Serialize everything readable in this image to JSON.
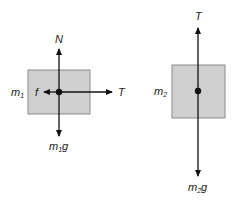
{
  "diagram": {
    "type": "free-body-diagrams",
    "colors": {
      "block_fill": "#cfcfcf",
      "block_stroke": "#8a8a8a",
      "arrow": "#111111"
    },
    "body1": {
      "mass_label": "m",
      "mass_sub": "1",
      "forces": {
        "up": "N",
        "right": "T",
        "left": "f",
        "down_main": "m",
        "down_sub": "1",
        "down_suffix": "g"
      }
    },
    "body2": {
      "mass_label": "m",
      "mass_sub": "2",
      "forces": {
        "up": "T",
        "down_main": "m",
        "down_sub": "2",
        "down_suffix": "g"
      }
    }
  }
}
